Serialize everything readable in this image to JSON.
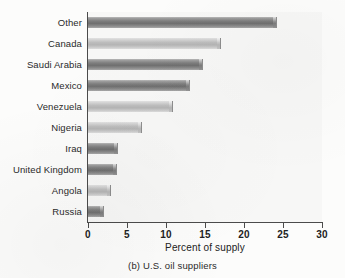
{
  "chart_data": {
    "type": "bar",
    "orientation": "horizontal",
    "title": "",
    "caption": "(b) U.S. oil suppliers",
    "xlabel": "Percent of supply",
    "ylabel": "",
    "xlim": [
      0,
      30
    ],
    "xticks": [
      0,
      5,
      10,
      15,
      20,
      25,
      30
    ],
    "grid": false,
    "legend": null,
    "categories": [
      "Other",
      "Canada",
      "Saudi Arabia",
      "Mexico",
      "Venezuela",
      "Nigeria",
      "Iraq",
      "United Kingdom",
      "Angola",
      "Russia"
    ],
    "values": [
      24.2,
      17.0,
      14.7,
      13.1,
      10.9,
      6.9,
      3.9,
      3.7,
      3.0,
      2.0
    ],
    "bar_shades": [
      "dark",
      "light",
      "dark",
      "dark",
      "light",
      "light",
      "dark",
      "dark",
      "light",
      "dark"
    ]
  },
  "colors": {
    "bar_dark": "#7e7e7e",
    "bar_light": "#bdbdbd",
    "axis": "#4b4b4b",
    "plot_background": "#f7f7f6",
    "page_background": "#fcfcfb",
    "text": "#222222"
  }
}
